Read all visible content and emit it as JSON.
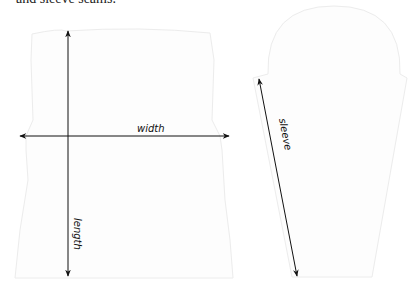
{
  "caption": "and sleeve seams.",
  "pieces": {
    "body": {
      "name": "body piece",
      "fill": "#fdfdfd",
      "stroke": "#ececec"
    },
    "sleeve": {
      "name": "sleeve piece",
      "fill": "#fdfdfd",
      "stroke": "#ececec"
    }
  },
  "measurements": {
    "width": {
      "label": "width"
    },
    "length": {
      "label": "length"
    },
    "sleeve": {
      "label": "sleeve"
    }
  },
  "colors": {
    "arrow": "#111111",
    "outline": "#ececec"
  }
}
